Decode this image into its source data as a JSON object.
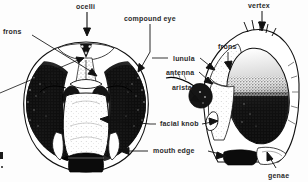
{
  "figure": {
    "style": "black-and-white stipple engraving",
    "background_color": "#fdfdfd",
    "ink_color": "#111111"
  },
  "labels": [
    {
      "id": "ocelli",
      "text": "ocelli",
      "x": 76,
      "y": 3,
      "align": "left"
    },
    {
      "id": "compound_eye",
      "text": "compound eye",
      "x": 124,
      "y": 15,
      "align": "left"
    },
    {
      "id": "vertex",
      "text": "vertex",
      "x": 248,
      "y": 2,
      "align": "left"
    },
    {
      "id": "frons_left",
      "text": "frons",
      "x": 3,
      "y": 28,
      "align": "left"
    },
    {
      "id": "lunula",
      "text": "lunula",
      "x": 173,
      "y": 55,
      "align": "left"
    },
    {
      "id": "frons_right",
      "text": "frons",
      "x": 218,
      "y": 43,
      "align": "left"
    },
    {
      "id": "antenna",
      "text": "antenna",
      "x": 166,
      "y": 69,
      "align": "left"
    },
    {
      "id": "arista",
      "text": "arista",
      "x": 172,
      "y": 84,
      "align": "left"
    },
    {
      "id": "facial_knob",
      "text": "facial knob",
      "x": 160,
      "y": 120,
      "align": "left"
    },
    {
      "id": "mouth_edge",
      "text": "mouth edge",
      "x": 153,
      "y": 147,
      "align": "left"
    },
    {
      "id": "genae",
      "text": "genae",
      "x": 268,
      "y": 172,
      "align": "left"
    }
  ],
  "views": [
    {
      "id": "frontal-head-view",
      "description": "frontal view of fly head with paired compound eyes, ocellar triangle, antennae, face and mouth edge"
    },
    {
      "id": "lateral-head-view",
      "description": "lateral profile of fly head showing vertex, frons, compound eye, facial knob, mouth edge and genae"
    }
  ]
}
